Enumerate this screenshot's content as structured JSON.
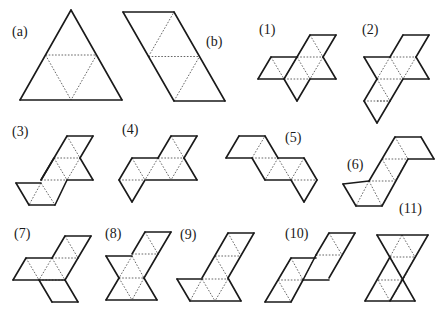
{
  "colors": {
    "solid": "#1a1a1a",
    "dotted": "#555555",
    "background": "#ffffff"
  },
  "figures": [
    {
      "id": "a",
      "label": "(a)",
      "label_pos": [
        12,
        36
      ],
      "solid": [
        [
          71,
          10,
          20,
          100
        ],
        [
          71,
          10,
          122,
          100
        ],
        [
          20,
          100,
          122,
          100
        ]
      ],
      "dotted": [
        [
          45.5,
          55,
          96.5,
          55
        ],
        [
          45.5,
          55,
          71,
          100
        ],
        [
          96.5,
          55,
          71,
          100
        ]
      ]
    },
    {
      "id": "b",
      "label": "(b)",
      "label_pos": [
        206,
        46
      ],
      "solid": [
        [
          123,
          12,
          174,
          12
        ],
        [
          123,
          12,
          174,
          101
        ],
        [
          174,
          12,
          225,
          101
        ],
        [
          174,
          101,
          225,
          101
        ]
      ],
      "dotted": [
        [
          148.5,
          56.5,
          199.5,
          56.5
        ],
        [
          148.5,
          56.5,
          174,
          12
        ],
        [
          174,
          101,
          199.5,
          56.5
        ]
      ]
    },
    {
      "id": "1",
      "label": "(1)",
      "label_pos": [
        259,
        34
      ],
      "solid": [
        [
          310,
          35,
          336,
          35
        ],
        [
          310,
          35,
          284,
          79
        ],
        [
          336,
          35,
          323,
          57
        ],
        [
          323,
          57,
          336,
          79
        ],
        [
          284,
          79,
          258,
          79
        ],
        [
          284,
          79,
          297,
          101
        ],
        [
          297,
          101,
          310,
          79
        ],
        [
          310,
          79,
          336,
          79
        ],
        [
          271,
          57,
          258,
          79
        ],
        [
          271,
          57,
          297,
          57
        ]
      ],
      "dotted": [
        [
          297,
          57,
          323,
          57
        ],
        [
          297,
          57,
          310,
          35
        ],
        [
          310,
          35,
          323,
          57
        ],
        [
          271,
          57,
          284,
          79
        ],
        [
          297,
          57,
          284,
          79
        ],
        [
          297,
          57,
          310,
          79
        ],
        [
          323,
          57,
          310,
          79
        ],
        [
          284,
          79,
          310,
          79
        ]
      ]
    },
    {
      "id": "2",
      "label": "(2)",
      "label_pos": [
        362,
        34
      ],
      "solid": [
        [
          403,
          35,
          429,
          35
        ],
        [
          403,
          35,
          390,
          57
        ],
        [
          429,
          35,
          416,
          57
        ],
        [
          416,
          57,
          429,
          79
        ],
        [
          429,
          79,
          403,
          79
        ],
        [
          364,
          57,
          390,
          57
        ],
        [
          364,
          57,
          377,
          79
        ],
        [
          377,
          79,
          364,
          101
        ],
        [
          364,
          101,
          377,
          123
        ],
        [
          377,
          123,
          390,
          101
        ],
        [
          403,
          79,
          390,
          101
        ]
      ],
      "dotted": [
        [
          390,
          57,
          416,
          57
        ],
        [
          390,
          57,
          403,
          79
        ],
        [
          416,
          57,
          403,
          79
        ],
        [
          390,
          57,
          377,
          79
        ],
        [
          377,
          79,
          403,
          79
        ],
        [
          377,
          79,
          390,
          101
        ],
        [
          377,
          101,
          390,
          101
        ],
        [
          364,
          101,
          390,
          101
        ]
      ]
    },
    {
      "id": "3",
      "label": "(3)",
      "label_pos": [
        12,
        136
      ],
      "solid": [
        [
          67,
          136,
          93,
          136
        ],
        [
          67,
          136,
          41,
          180
        ],
        [
          93,
          136,
          80,
          158
        ],
        [
          80,
          158,
          93,
          180
        ],
        [
          93,
          180,
          67,
          180
        ],
        [
          16,
          183,
          41,
          183
        ],
        [
          16,
          183,
          29,
          205
        ],
        [
          29,
          205,
          55,
          205
        ],
        [
          67,
          180,
          55,
          205
        ],
        [
          41,
          180,
          54,
          158
        ]
      ],
      "dotted": [
        [
          54,
          158,
          80,
          158
        ],
        [
          54,
          158,
          67,
          180
        ],
        [
          67,
          136,
          80,
          158
        ],
        [
          80,
          158,
          67,
          180
        ],
        [
          41,
          180,
          67,
          180
        ],
        [
          41,
          183,
          29,
          205
        ],
        [
          41,
          183,
          55,
          205
        ]
      ]
    },
    {
      "id": "4",
      "label": "(4)",
      "label_pos": [
        122,
        134
      ],
      "solid": [
        [
          171,
          136,
          197,
          136
        ],
        [
          171,
          136,
          158,
          158
        ],
        [
          197,
          136,
          184,
          158
        ],
        [
          184,
          158,
          197,
          180
        ],
        [
          197,
          180,
          146,
          180
        ],
        [
          132,
          158,
          158,
          158
        ],
        [
          132,
          158,
          119,
          180
        ],
        [
          119,
          180,
          132,
          202
        ],
        [
          132,
          202,
          145,
          180
        ]
      ],
      "dotted": [
        [
          158,
          158,
          184,
          158
        ],
        [
          158,
          158,
          171,
          180
        ],
        [
          184,
          158,
          171,
          180
        ],
        [
          171,
          136,
          184,
          158
        ],
        [
          132,
          158,
          145,
          180
        ],
        [
          158,
          158,
          145,
          180
        ],
        [
          119,
          180,
          145,
          180
        ]
      ]
    },
    {
      "id": "5",
      "label": "(5)",
      "label_pos": [
        285,
        142
      ],
      "solid": [
        [
          239,
          136,
          265,
          136
        ],
        [
          239,
          136,
          226,
          158
        ],
        [
          226,
          158,
          252,
          158
        ],
        [
          265,
          136,
          278,
          158
        ],
        [
          278,
          158,
          304,
          158
        ],
        [
          304,
          158,
          317,
          180
        ],
        [
          252,
          158,
          265,
          180
        ],
        [
          265,
          180,
          291,
          180
        ],
        [
          291,
          180,
          304,
          202
        ],
        [
          304,
          202,
          317,
          180
        ]
      ],
      "dotted": [
        [
          252,
          158,
          265,
          136
        ],
        [
          252,
          158,
          278,
          158
        ],
        [
          278,
          158,
          265,
          180
        ],
        [
          278,
          158,
          291,
          180
        ],
        [
          291,
          180,
          317,
          180
        ],
        [
          304,
          158,
          291,
          180
        ]
      ]
    },
    {
      "id": "6",
      "label": "(6)",
      "label_pos": [
        347,
        169
      ],
      "solid": [
        [
          395,
          137,
          421,
          137
        ],
        [
          395,
          137,
          369,
          181
        ],
        [
          369,
          181,
          343,
          184
        ],
        [
          421,
          137,
          434,
          159
        ],
        [
          434,
          159,
          408,
          159
        ],
        [
          408,
          159,
          382,
          206
        ],
        [
          343,
          184,
          356,
          206
        ],
        [
          356,
          206,
          382,
          206
        ]
      ],
      "dotted": [
        [
          382,
          159,
          408,
          159
        ],
        [
          395,
          137,
          408,
          159
        ],
        [
          382,
          159,
          395,
          181
        ],
        [
          408,
          159,
          395,
          181
        ],
        [
          369,
          181,
          395,
          181
        ],
        [
          369,
          181,
          356,
          206
        ],
        [
          369,
          181,
          382,
          206
        ]
      ]
    },
    {
      "id": "7",
      "label": "(7)",
      "label_pos": [
        14,
        238
      ],
      "solid": [
        [
          65,
          236,
          91,
          236
        ],
        [
          65,
          236,
          52,
          258
        ],
        [
          91,
          236,
          78,
          258
        ],
        [
          26,
          258,
          52,
          258
        ],
        [
          26,
          258,
          13,
          280
        ],
        [
          13,
          280,
          39,
          280
        ],
        [
          39,
          280,
          65,
          280
        ],
        [
          65,
          280,
          78,
          258
        ],
        [
          65,
          280,
          78,
          302
        ],
        [
          78,
          302,
          52,
          302
        ],
        [
          52,
          302,
          39,
          280
        ]
      ],
      "dotted": [
        [
          52,
          258,
          78,
          258
        ],
        [
          65,
          236,
          78,
          258
        ],
        [
          52,
          258,
          39,
          280
        ],
        [
          52,
          258,
          65,
          280
        ],
        [
          26,
          258,
          39,
          280
        ],
        [
          39,
          280,
          65,
          280
        ]
      ]
    },
    {
      "id": "8",
      "label": "(8)",
      "label_pos": [
        105,
        238
      ],
      "solid": [
        [
          145,
          232,
          171,
          232
        ],
        [
          145,
          232,
          132,
          254
        ],
        [
          171,
          232,
          158,
          254
        ],
        [
          106,
          256,
          132,
          256
        ],
        [
          106,
          256,
          119,
          278
        ],
        [
          119,
          278,
          106,
          300
        ],
        [
          106,
          300,
          157,
          300
        ],
        [
          157,
          300,
          144,
          278
        ],
        [
          144,
          278,
          158,
          254
        ]
      ],
      "dotted": [
        [
          132,
          254,
          158,
          254
        ],
        [
          145,
          232,
          158,
          254
        ],
        [
          132,
          256,
          119,
          278
        ],
        [
          132,
          256,
          144,
          278
        ],
        [
          119,
          278,
          144,
          278
        ],
        [
          119,
          278,
          132,
          300
        ],
        [
          144,
          278,
          132,
          300
        ]
      ]
    },
    {
      "id": "9",
      "label": "(9)",
      "label_pos": [
        180,
        239
      ],
      "solid": [
        [
          228,
          233,
          254,
          233
        ],
        [
          228,
          233,
          202,
          278
        ],
        [
          254,
          233,
          228,
          278
        ],
        [
          177,
          279,
          202,
          279
        ],
        [
          177,
          279,
          190,
          301
        ],
        [
          190,
          301,
          241,
          301
        ],
        [
          241,
          301,
          228,
          278
        ]
      ],
      "dotted": [
        [
          215,
          256,
          241,
          256
        ],
        [
          228,
          233,
          241,
          256
        ],
        [
          215,
          256,
          228,
          278
        ],
        [
          202,
          279,
          228,
          279
        ],
        [
          202,
          279,
          190,
          301
        ],
        [
          202,
          279,
          215,
          301
        ],
        [
          228,
          279,
          215,
          301
        ]
      ]
    },
    {
      "id": "10",
      "label": "(10)",
      "label_pos": [
        285,
        238
      ],
      "solid": [
        [
          329,
          233,
          355,
          233
        ],
        [
          329,
          233,
          316,
          255
        ],
        [
          355,
          233,
          329,
          278
        ],
        [
          291,
          258,
          316,
          258
        ],
        [
          291,
          258,
          265,
          302
        ],
        [
          265,
          302,
          291,
          302
        ],
        [
          291,
          302,
          303,
          280
        ],
        [
          303,
          280,
          329,
          280
        ],
        [
          316,
          255,
          303,
          280
        ]
      ],
      "dotted": [
        [
          316,
          255,
          342,
          255
        ],
        [
          329,
          233,
          342,
          255
        ],
        [
          303,
          280,
          316,
          255
        ],
        [
          291,
          258,
          303,
          280
        ],
        [
          278,
          280,
          303,
          280
        ],
        [
          278,
          280,
          291,
          302
        ],
        [
          291,
          258,
          278,
          280
        ]
      ]
    },
    {
      "id": "11",
      "label": "(11)",
      "label_pos": [
        399,
        213
      ],
      "solid": [
        [
          377,
          235,
          428,
          235
        ],
        [
          377,
          235,
          403,
          280
        ],
        [
          428,
          235,
          390,
          301
        ],
        [
          403,
          280,
          415,
          301
        ],
        [
          365,
          301,
          415,
          301
        ],
        [
          365,
          301,
          390,
          257
        ]
      ],
      "dotted": [
        [
          390,
          257,
          415,
          257
        ],
        [
          402,
          235,
          390,
          257
        ],
        [
          402,
          235,
          415,
          257
        ],
        [
          390,
          257,
          403,
          280
        ],
        [
          415,
          257,
          403,
          280
        ],
        [
          378,
          280,
          403,
          280
        ],
        [
          378,
          280,
          390,
          301
        ],
        [
          403,
          280,
          390,
          301
        ]
      ]
    }
  ]
}
